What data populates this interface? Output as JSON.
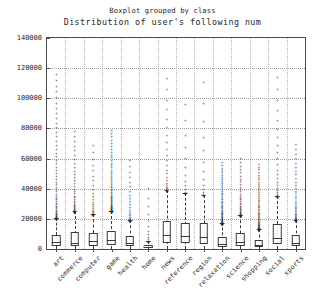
{
  "chart_data": {
    "type": "box",
    "title": "Boxplot grouped by class",
    "subtitle": "Distribution of user's following num",
    "xlabel": "",
    "ylabel": "",
    "ylim": [
      0,
      140000
    ],
    "yticks": [
      0,
      20000,
      40000,
      60000,
      80000,
      100000,
      120000,
      140000
    ],
    "ytick_labels": [
      "0",
      "20000",
      "40000",
      "60000",
      "80000",
      "100000",
      "120000",
      "140000"
    ],
    "grid": true,
    "legend": "none",
    "categories": [
      "art",
      "commerce",
      "computer",
      "game",
      "health",
      "home",
      "news",
      "reference",
      "region",
      "relaxation",
      "science",
      "shopping",
      "social",
      "sports"
    ],
    "boxes": [
      {
        "category": "art",
        "whisker_low": 0,
        "q1": 2000,
        "median": 4600,
        "q3": 9500,
        "whisker_high": 20500,
        "outlier_max": 119000,
        "outlier_density": "very-high"
      },
      {
        "category": "commerce",
        "whisker_low": 0,
        "q1": 1700,
        "median": 3800,
        "q3": 11500,
        "whisker_high": 25000,
        "outlier_max": 81000,
        "outlier_density": "high"
      },
      {
        "category": "computer",
        "whisker_low": 0,
        "q1": 2200,
        "median": 5000,
        "q3": 10500,
        "whisker_high": 23000,
        "outlier_max": 72000,
        "outlier_density": "medium"
      },
      {
        "category": "game",
        "whisker_low": 0,
        "q1": 2400,
        "median": 6000,
        "q3": 12000,
        "whisker_high": 25500,
        "outlier_max": 81000,
        "outlier_density": "very-high"
      },
      {
        "category": "health",
        "whisker_low": 0,
        "q1": 1800,
        "median": 4200,
        "q3": 8500,
        "whisker_high": 19000,
        "outlier_max": 62000,
        "outlier_density": "medium"
      },
      {
        "category": "home",
        "whisker_low": 0,
        "q1": 700,
        "median": 1500,
        "q3": 2600,
        "whisker_high": 5000,
        "outlier_max": 45000,
        "outlier_density": "low"
      },
      {
        "category": "news",
        "whisker_low": 0,
        "q1": 4200,
        "median": 9500,
        "q3": 18500,
        "whisker_high": 39000,
        "outlier_max": 118000,
        "outlier_density": "medium"
      },
      {
        "category": "reference",
        "whisker_low": 0,
        "q1": 3800,
        "median": 8800,
        "q3": 17500,
        "whisker_high": 37000,
        "outlier_max": 103000,
        "outlier_density": "low"
      },
      {
        "category": "region",
        "whisker_low": 0,
        "q1": 3600,
        "median": 8000,
        "q3": 17000,
        "whisker_high": 36000,
        "outlier_max": 119000,
        "outlier_density": "low"
      },
      {
        "category": "relaxation",
        "whisker_low": 0,
        "q1": 1600,
        "median": 3600,
        "q3": 7800,
        "whisker_high": 17000,
        "outlier_max": 59000,
        "outlier_density": "very-high"
      },
      {
        "category": "science",
        "whisker_low": 0,
        "q1": 2000,
        "median": 4800,
        "q3": 10500,
        "whisker_high": 22500,
        "outlier_max": 62000,
        "outlier_density": "high"
      },
      {
        "category": "shopping",
        "whisker_low": 0,
        "q1": 1200,
        "median": 2800,
        "q3": 6200,
        "whisker_high": 13500,
        "outlier_max": 58000,
        "outlier_density": "very-high"
      },
      {
        "category": "social",
        "whisker_low": 0,
        "q1": 3000,
        "median": 7500,
        "q3": 16500,
        "whisker_high": 35000,
        "outlier_max": 119000,
        "outlier_density": "medium"
      },
      {
        "category": "sports",
        "whisker_low": 0,
        "q1": 1800,
        "median": 4000,
        "q3": 9000,
        "whisker_high": 19500,
        "outlier_max": 72000,
        "outlier_density": "high"
      }
    ],
    "colors": {
      "axis": "#4a4a4a",
      "grid": "#9a9a9a",
      "marker": "#2b2b2b",
      "text": "#1f1f1f"
    }
  }
}
